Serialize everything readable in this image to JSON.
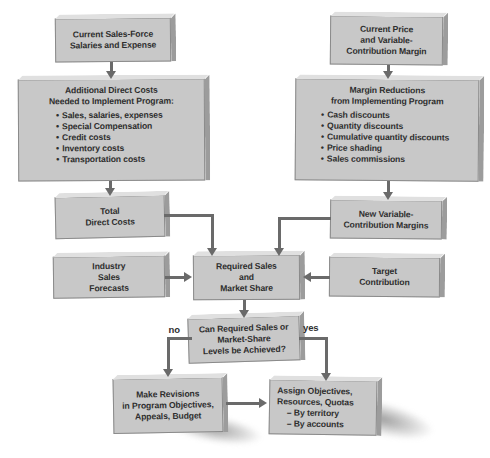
{
  "diagram": {
    "glyphs": {
      "bullet": "•"
    },
    "edge_labels": {
      "no": "no",
      "yes": "yes"
    },
    "colors": {
      "box_face": "#c8c8c8",
      "box_side": "#9c9c9c",
      "box_top_highlight": "#e0e0e0",
      "arrow": "#6a6a6a",
      "text": "#2e2e2e",
      "background": "#ffffff"
    },
    "nodes": {
      "current_sales_force": {
        "lines": [
          "Current Sales-Force",
          "Salaries and Expense"
        ]
      },
      "current_price": {
        "lines": [
          "Current Price",
          "and Variable-",
          "Contribution Margin"
        ]
      },
      "additional_direct_costs": {
        "title": [
          "Additional Direct Costs",
          "Needed to Implement Program:"
        ],
        "bullets": [
          "Sales, salaries, expenses",
          "Special Compensation",
          "Credit costs",
          "Inventory costs",
          "Transportation costs"
        ]
      },
      "margin_reductions": {
        "title": [
          "Margin Reductions",
          "from Implementing Program"
        ],
        "bullets": [
          "Cash discounts",
          "Quantity discounts",
          "Cumulative quantity discounts",
          "Price shading",
          "Sales commissions"
        ]
      },
      "total_direct_costs": {
        "lines": [
          "Total",
          "Direct Costs"
        ]
      },
      "industry_sales_forecasts": {
        "lines": [
          "Industry",
          "Sales",
          "Forecasts"
        ]
      },
      "new_variable_margins": {
        "lines": [
          "New Variable-",
          "Contribution Margins"
        ]
      },
      "required_sales": {
        "lines": [
          "Required Sales",
          "and",
          "Market Share"
        ]
      },
      "target_contribution": {
        "lines": [
          "Target",
          "Contribution"
        ]
      },
      "can_required": {
        "lines": [
          "Can Required Sales or",
          "Market-Share",
          "Levels be Achieved?"
        ]
      },
      "make_revisions": {
        "lines": [
          "Make Revisions",
          "in Program Objectives,",
          "Appeals, Budget"
        ]
      },
      "assign_objectives": {
        "lines": [
          "Assign Objectives,",
          "Resources, Quotas",
          "– By territory",
          "– By accounts"
        ]
      }
    }
  }
}
